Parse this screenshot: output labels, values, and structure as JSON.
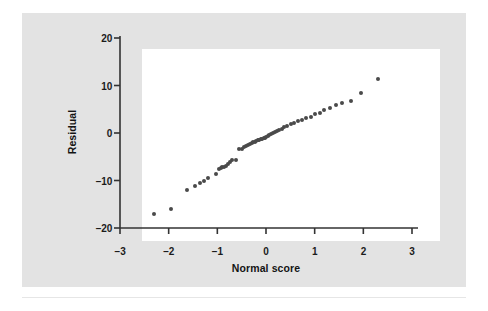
{
  "figure": {
    "background_color": "#ffffff",
    "panel_color": "#e3e3e3",
    "plot_background_color": "#ffffff",
    "axis_color": "#333333",
    "point_color": "#4a4a4a"
  },
  "chart_data": {
    "type": "scatter",
    "title": "",
    "subtitle": "",
    "xlabel": "Normal score",
    "ylabel": "Residual",
    "xlim": [
      -3,
      3
    ],
    "ylim": [
      -20,
      20
    ],
    "xticks": [
      -3,
      -2,
      -1,
      0,
      1,
      2,
      3
    ],
    "xtick_labels": [
      "−3",
      "−2",
      "−1",
      "0",
      "1",
      "2",
      "3"
    ],
    "yticks": [
      -20,
      -10,
      0,
      10,
      20
    ],
    "ytick_labels": [
      "−20",
      "−10",
      "0",
      "10",
      "20"
    ],
    "grid": false,
    "legend": null,
    "annotations": [],
    "marker": "circle",
    "marker_size_px": 4,
    "series": [
      {
        "name": "Residuals vs normal score",
        "x": [
          -2.31,
          -1.95,
          -1.63,
          -1.46,
          -1.36,
          -1.27,
          -1.19,
          -1.02,
          -0.96,
          -0.93,
          -0.9,
          -0.86,
          -0.82,
          -0.78,
          -0.74,
          -0.7,
          -0.62,
          -0.56,
          -0.5,
          -0.45,
          -0.41,
          -0.37,
          -0.33,
          -0.29,
          -0.26,
          -0.23,
          -0.2,
          -0.17,
          -0.14,
          -0.11,
          -0.08,
          -0.05,
          -0.02,
          0.01,
          0.04,
          0.07,
          0.1,
          0.14,
          0.18,
          0.22,
          0.27,
          0.32,
          0.38,
          0.44,
          0.51,
          0.58,
          0.66,
          0.74,
          0.83,
          0.92,
          1.01,
          1.1,
          1.2,
          1.31,
          1.43,
          1.57,
          1.74,
          1.95,
          2.31
        ],
        "y": [
          -17.0,
          -16.1,
          -12.0,
          -11.2,
          -10.6,
          -10.1,
          -9.4,
          -8.6,
          -7.5,
          -7.3,
          -7.2,
          -7.1,
          -7.0,
          -6.6,
          -6.1,
          -5.7,
          -5.6,
          -3.4,
          -3.3,
          -3.0,
          -2.7,
          -2.5,
          -2.3,
          -2.1,
          -1.9,
          -1.8,
          -1.6,
          -1.5,
          -1.4,
          -1.3,
          -1.2,
          -1.1,
          -1.0,
          -0.8,
          -0.6,
          -0.4,
          -0.2,
          0.0,
          0.2,
          0.4,
          0.7,
          0.9,
          1.2,
          1.5,
          1.8,
          2.1,
          2.5,
          2.7,
          3.1,
          3.4,
          3.9,
          4.3,
          4.8,
          5.3,
          5.8,
          6.3,
          6.8,
          8.5,
          11.4
        ]
      }
    ]
  }
}
